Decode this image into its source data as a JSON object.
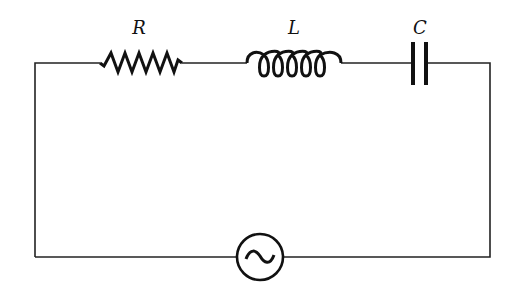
{
  "diagram": {
    "type": "series RLC circuit",
    "components": [
      {
        "id": "resistor",
        "label": "R",
        "symbol": "zigzag resistor"
      },
      {
        "id": "inductor",
        "label": "L",
        "symbol": "coil inductor"
      },
      {
        "id": "capacitor",
        "label": "C",
        "symbol": "parallel-plate capacitor"
      },
      {
        "id": "source",
        "label": "",
        "symbol": "AC voltage source (sine wave in circle)"
      }
    ],
    "labels": {
      "R": "R",
      "L": "L",
      "C": "C"
    },
    "colors": {
      "line": "#222222",
      "background": "#ffffff"
    }
  }
}
